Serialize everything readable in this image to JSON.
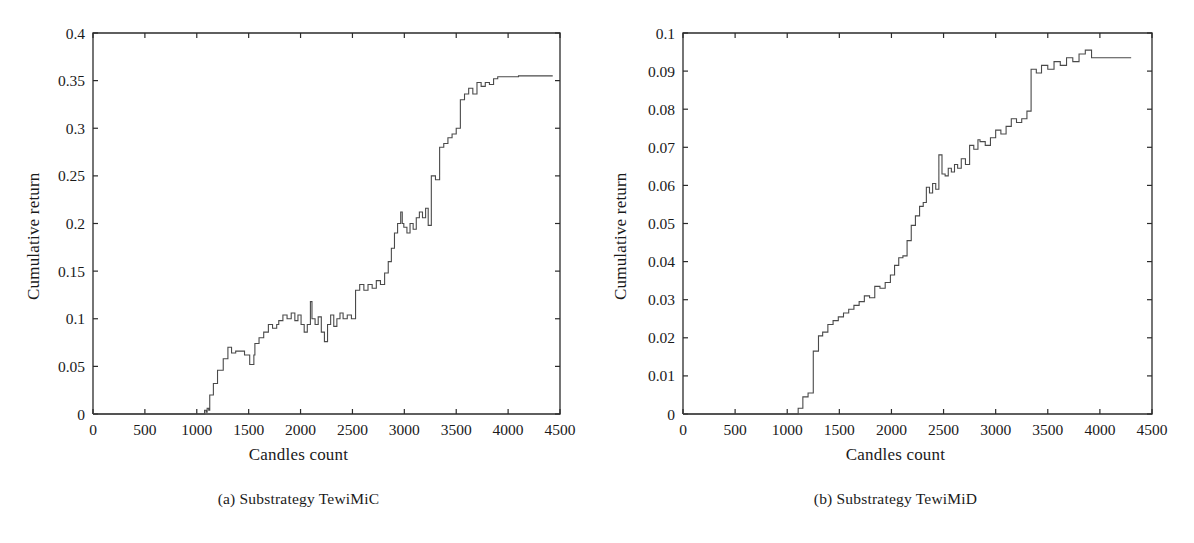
{
  "figure": {
    "background": "#ffffff",
    "ink_color": "#2b2b2b"
  },
  "panels": [
    {
      "id": "panel-a",
      "caption": "(a)  Substrategy TewiMiC",
      "caption_prefix": "(a)",
      "caption_text": "Substrategy TewiMiC"
    },
    {
      "id": "panel-b",
      "caption": "(b)  Substrategy TewiMiD",
      "caption_prefix": "(b)",
      "caption_text": "Substrategy TewiMiD"
    }
  ],
  "chart_data": [
    {
      "type": "line",
      "title": "",
      "subtitle": "(a)  Substrategy TewiMiC",
      "xlabel": "Candles count",
      "ylabel": "Cumulative return",
      "xlim": [
        0,
        4500
      ],
      "ylim": [
        0,
        0.4
      ],
      "xticks": [
        0,
        500,
        1000,
        1500,
        2000,
        2500,
        3000,
        3500,
        4000,
        4500
      ],
      "xticklabels": [
        "0",
        "500",
        "1000",
        "1500",
        "2000",
        "2500",
        "3000",
        "3500",
        "4000",
        "4500"
      ],
      "yticks": [
        0,
        0.05,
        0.1,
        0.15,
        0.2,
        0.25,
        0.3,
        0.35,
        0.4
      ],
      "yticklabels": [
        "0",
        "0.05",
        "0.1",
        "0.15",
        "0.2",
        "0.25",
        "0.3",
        "0.35",
        "0.4"
      ],
      "grid": false,
      "legend": null,
      "line_color": "#4a4a4a",
      "step": true,
      "series": [
        {
          "name": "Cumulative return",
          "x": [
            0,
            1060,
            1075,
            1090,
            1100,
            1115,
            1125,
            1140,
            1160,
            1180,
            1200,
            1230,
            1255,
            1280,
            1300,
            1320,
            1335,
            1350,
            1375,
            1400,
            1430,
            1460,
            1490,
            1510,
            1530,
            1550,
            1560,
            1580,
            1600,
            1620,
            1645,
            1670,
            1690,
            1710,
            1730,
            1750,
            1770,
            1790,
            1810,
            1830,
            1850,
            1870,
            1890,
            1910,
            1930,
            1945,
            1960,
            1975,
            1990,
            2005,
            2020,
            2035,
            2050,
            2065,
            2080,
            2095,
            2110,
            2125,
            2140,
            2155,
            2170,
            2185,
            2200,
            2215,
            2230,
            2245,
            2260,
            2275,
            2290,
            2305,
            2320,
            2335,
            2350,
            2365,
            2380,
            2395,
            2410,
            2430,
            2450,
            2470,
            2490,
            2510,
            2530,
            2550,
            2570,
            2590,
            2610,
            2630,
            2650,
            2670,
            2690,
            2710,
            2730,
            2750,
            2770,
            2790,
            2810,
            2830,
            2845,
            2860,
            2875,
            2890,
            2905,
            2920,
            2935,
            2950,
            2965,
            2980,
            2995,
            3010,
            3025,
            3040,
            3055,
            3070,
            3085,
            3100,
            3115,
            3130,
            3145,
            3160,
            3175,
            3190,
            3205,
            3215,
            3230,
            3245,
            3260,
            3280,
            3300,
            3320,
            3340,
            3360,
            3380,
            3400,
            3420,
            3440,
            3460,
            3480,
            3500,
            3520,
            3540,
            3560,
            3580,
            3600,
            3620,
            3640,
            3660,
            3680,
            3700,
            3720,
            3740,
            3760,
            3780,
            3800,
            3820,
            3840,
            3860,
            3880,
            3900,
            3950,
            4000,
            4100,
            4200,
            4300,
            4400,
            4430
          ],
          "y": [
            0,
            0,
            0.004,
            0.002,
            0.006,
            0.004,
            0.02,
            0.02,
            0.032,
            0.032,
            0.046,
            0.046,
            0.058,
            0.058,
            0.07,
            0.07,
            0.064,
            0.064,
            0.066,
            0.066,
            0.066,
            0.062,
            0.062,
            0.052,
            0.052,
            0.062,
            0.074,
            0.074,
            0.08,
            0.08,
            0.086,
            0.086,
            0.094,
            0.094,
            0.09,
            0.09,
            0.094,
            0.098,
            0.098,
            0.104,
            0.104,
            0.1,
            0.1,
            0.106,
            0.106,
            0.098,
            0.098,
            0.104,
            0.104,
            0.094,
            0.094,
            0.086,
            0.086,
            0.094,
            0.094,
            0.118,
            0.1,
            0.1,
            0.094,
            0.094,
            0.102,
            0.102,
            0.086,
            0.086,
            0.076,
            0.076,
            0.094,
            0.094,
            0.104,
            0.104,
            0.092,
            0.092,
            0.1,
            0.1,
            0.106,
            0.106,
            0.1,
            0.1,
            0.104,
            0.104,
            0.1,
            0.1,
            0.13,
            0.13,
            0.136,
            0.136,
            0.13,
            0.13,
            0.136,
            0.136,
            0.132,
            0.132,
            0.14,
            0.14,
            0.136,
            0.136,
            0.148,
            0.148,
            0.16,
            0.16,
            0.174,
            0.174,
            0.19,
            0.19,
            0.2,
            0.2,
            0.212,
            0.2,
            0.196,
            0.196,
            0.19,
            0.19,
            0.2,
            0.2,
            0.194,
            0.194,
            0.206,
            0.206,
            0.212,
            0.212,
            0.206,
            0.206,
            0.216,
            0.216,
            0.198,
            0.198,
            0.25,
            0.25,
            0.246,
            0.246,
            0.28,
            0.28,
            0.284,
            0.284,
            0.29,
            0.29,
            0.294,
            0.294,
            0.3,
            0.3,
            0.33,
            0.33,
            0.336,
            0.336,
            0.342,
            0.342,
            0.336,
            0.336,
            0.348,
            0.348,
            0.344,
            0.344,
            0.348,
            0.348,
            0.346,
            0.346,
            0.352,
            0.352,
            0.354,
            0.354,
            0.354,
            0.355,
            0.355,
            0.355,
            0.355,
            0.355
          ]
        }
      ]
    },
    {
      "type": "line",
      "title": "",
      "subtitle": "(b)  Substrategy TewiMiD",
      "xlabel": "Candles count",
      "ylabel": "Cumulative return",
      "xlim": [
        0,
        4500
      ],
      "ylim": [
        0,
        0.1
      ],
      "xticks": [
        0,
        500,
        1000,
        1500,
        2000,
        2500,
        3000,
        3500,
        4000,
        4500
      ],
      "xticklabels": [
        "0",
        "500",
        "1000",
        "1500",
        "2000",
        "2500",
        "3000",
        "3500",
        "4000",
        "4500"
      ],
      "yticks": [
        0,
        0.01,
        0.02,
        0.03,
        0.04,
        0.05,
        0.06,
        0.07,
        0.08,
        0.09,
        0.1
      ],
      "yticklabels": [
        "0",
        "0.01",
        "0.02",
        "0.03",
        "0.04",
        "0.05",
        "0.06",
        "0.07",
        "0.08",
        "0.09",
        "0.1"
      ],
      "grid": false,
      "legend": null,
      "line_color": "#4a4a4a",
      "step": true,
      "series": [
        {
          "name": "Cumulative return",
          "x": [
            0,
            1090,
            1105,
            1130,
            1150,
            1175,
            1200,
            1225,
            1250,
            1275,
            1300,
            1320,
            1340,
            1365,
            1390,
            1415,
            1440,
            1465,
            1490,
            1515,
            1540,
            1565,
            1590,
            1615,
            1640,
            1665,
            1690,
            1715,
            1740,
            1765,
            1790,
            1815,
            1840,
            1865,
            1890,
            1915,
            1940,
            1965,
            1990,
            2010,
            2030,
            2050,
            2070,
            2090,
            2110,
            2130,
            2150,
            2170,
            2190,
            2210,
            2230,
            2250,
            2270,
            2290,
            2305,
            2320,
            2335,
            2350,
            2365,
            2380,
            2395,
            2410,
            2425,
            2440,
            2455,
            2470,
            2485,
            2500,
            2515,
            2530,
            2545,
            2560,
            2575,
            2590,
            2605,
            2620,
            2635,
            2650,
            2670,
            2690,
            2710,
            2730,
            2750,
            2770,
            2790,
            2810,
            2830,
            2850,
            2875,
            2900,
            2925,
            2950,
            2975,
            3000,
            3025,
            3050,
            3075,
            3100,
            3125,
            3150,
            3175,
            3200,
            3225,
            3250,
            3275,
            3300,
            3320,
            3340,
            3365,
            3390,
            3415,
            3440,
            3470,
            3500,
            3530,
            3560,
            3590,
            3620,
            3650,
            3680,
            3710,
            3740,
            3770,
            3800,
            3830,
            3860,
            3890,
            3920,
            3950,
            3980,
            4010,
            4040,
            4070,
            4100,
            4200,
            4300,
            4400,
            4430
          ],
          "y": [
            0,
            0,
            0.0015,
            0.0015,
            0.0045,
            0.0045,
            0.0055,
            0.0055,
            0.0165,
            0.0165,
            0.0205,
            0.0205,
            0.0215,
            0.0215,
            0.0235,
            0.0235,
            0.0245,
            0.0245,
            0.0255,
            0.0255,
            0.0265,
            0.0265,
            0.0275,
            0.0275,
            0.0285,
            0.0285,
            0.0295,
            0.0295,
            0.031,
            0.031,
            0.0305,
            0.0305,
            0.0335,
            0.0335,
            0.033,
            0.033,
            0.0345,
            0.0345,
            0.0365,
            0.0365,
            0.039,
            0.039,
            0.041,
            0.041,
            0.0415,
            0.0415,
            0.0455,
            0.0455,
            0.0495,
            0.0495,
            0.052,
            0.052,
            0.0545,
            0.0545,
            0.0555,
            0.0555,
            0.0595,
            0.0595,
            0.058,
            0.058,
            0.0605,
            0.0605,
            0.059,
            0.059,
            0.068,
            0.068,
            0.063,
            0.063,
            0.0625,
            0.0625,
            0.0645,
            0.0645,
            0.0635,
            0.0635,
            0.0655,
            0.0655,
            0.0645,
            0.0645,
            0.067,
            0.067,
            0.0655,
            0.0655,
            0.0705,
            0.0705,
            0.0695,
            0.0695,
            0.072,
            0.0715,
            0.0715,
            0.0705,
            0.0705,
            0.0725,
            0.0725,
            0.0745,
            0.0745,
            0.0735,
            0.0735,
            0.0755,
            0.0755,
            0.0775,
            0.0775,
            0.0765,
            0.0765,
            0.0775,
            0.0775,
            0.0795,
            0.0795,
            0.0905,
            0.0905,
            0.0895,
            0.0895,
            0.0915,
            0.0915,
            0.0905,
            0.0905,
            0.0925,
            0.0925,
            0.0915,
            0.0915,
            0.0935,
            0.0935,
            0.0925,
            0.0925,
            0.0945,
            0.0945,
            0.0955,
            0.0955,
            0.0935,
            0.0935,
            0.0935,
            0.0935,
            0.0935,
            0.0935,
            0.0935,
            0.0935
          ]
        }
      ]
    }
  ]
}
